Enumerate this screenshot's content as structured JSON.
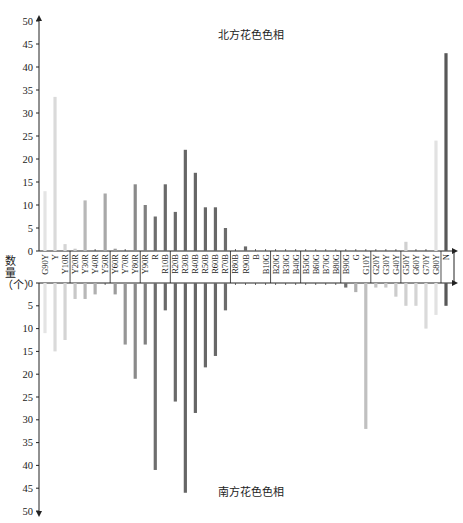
{
  "chart_data": {
    "type": "bar",
    "title_top": "北方花色色相",
    "title_bottom": "南方花色色相",
    "ylabel": "数量（个）",
    "ylim": [
      0,
      50
    ],
    "yticks": [
      0,
      5,
      10,
      15,
      20,
      25,
      30,
      35,
      40,
      45,
      50
    ],
    "categories": [
      "G90Y",
      "Y",
      "Y10R",
      "Y20R",
      "Y30R",
      "Y40R",
      "Y50R",
      "Y60R",
      "Y70R",
      "Y80R",
      "Y90R",
      "R",
      "R10B",
      "R20B",
      "R30B",
      "R40B",
      "R50B",
      "R60B",
      "R70B",
      "R80B",
      "R90B",
      "B",
      "B10G",
      "B20G",
      "B30G",
      "B40G",
      "B50G",
      "B60G",
      "B70G",
      "B80G",
      "B90G",
      "G",
      "G10Y",
      "G20Y",
      "G30Y",
      "G40Y",
      "G50Y",
      "G60Y",
      "G70Y",
      "G80Y",
      "N"
    ],
    "group_breaks_after": [
      "Y10R",
      "Y50R",
      "Y80R",
      "R10B",
      "R70B",
      "B10G",
      "B40G",
      "B80G",
      "G10Y",
      "G40Y",
      "G80Y"
    ],
    "series": [
      {
        "name": "北方花色色相",
        "direction": "up",
        "values": [
          13,
          33.5,
          1.5,
          0.5,
          11,
          0,
          12.5,
          0.5,
          0,
          14.5,
          10,
          7.5,
          14.5,
          8.5,
          22,
          17,
          9.5,
          9.5,
          5,
          0,
          1,
          0,
          0,
          0,
          0,
          0,
          0,
          0,
          0,
          0,
          0,
          0,
          0,
          0,
          0,
          0,
          2,
          0,
          0,
          24,
          43
        ]
      },
      {
        "name": "南方花色色相",
        "direction": "down",
        "values": [
          11,
          15,
          12.5,
          3.5,
          3.5,
          2.5,
          0,
          2.5,
          13.5,
          21,
          13.5,
          41,
          6,
          26,
          46,
          28.5,
          18.5,
          16,
          6,
          0,
          0,
          0,
          0,
          0,
          0,
          0,
          0,
          0,
          0,
          0,
          1,
          2,
          32,
          1,
          1,
          3,
          5,
          5,
          10,
          7,
          5
        ]
      }
    ],
    "bar_colors": [
      "#e4e4e4",
      "#dadada",
      "#d4d4d4",
      "#c8c8c8",
      "#b8b8b8",
      "#b0b0b0",
      "#a8a8a8",
      "#9c9c9c",
      "#969696",
      "#8a8a8a",
      "#808080",
      "#6e6e6e",
      "#6a6a6a",
      "#6a6a6a",
      "#666666",
      "#666666",
      "#686868",
      "#686868",
      "#6c6c6c",
      "#777777",
      "#6a6a6a",
      "#888888",
      "#999999",
      "#999999",
      "#999999",
      "#999999",
      "#999999",
      "#999999",
      "#999999",
      "#999999",
      "#707070",
      "#b0b0b0",
      "#c0c0c0",
      "#c4c4c4",
      "#c8c8c8",
      "#cccccc",
      "#d0d0d0",
      "#d4d4d4",
      "#dadada",
      "#e2e2e2",
      "#585858"
    ]
  }
}
